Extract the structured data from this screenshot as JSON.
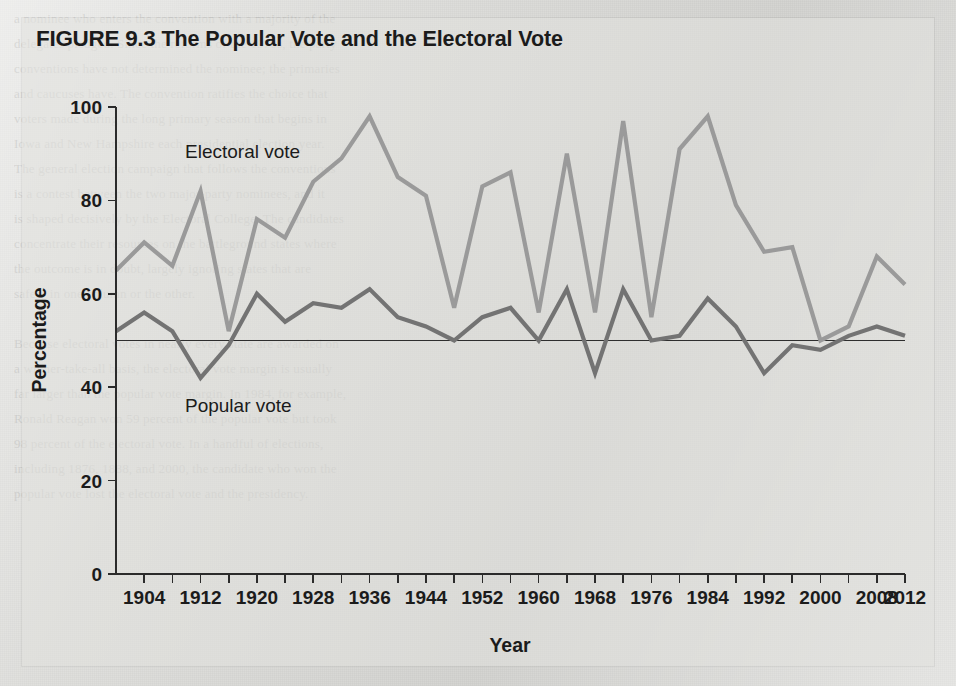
{
  "figure": {
    "number": "FIGURE 9.3",
    "title": "The Popular Vote and the Electoral Vote"
  },
  "axes": {
    "y_title": "Percentage",
    "x_title": "Year",
    "y_ticks": [
      "0",
      "20",
      "40",
      "60",
      "80",
      "100"
    ],
    "x_ticks": [
      "1904",
      "1912",
      "1920",
      "1928",
      "1936",
      "1944",
      "1952",
      "1960",
      "1968",
      "1976",
      "1984",
      "1992",
      "2000",
      "2008",
      "2012"
    ]
  },
  "annotations": {
    "electoral_label": "Electoral vote",
    "popular_label": "Popular vote"
  },
  "colors": {
    "electoral": "#9a9a9a",
    "popular": "#737373",
    "axis": "#2b2b2b",
    "background": "#dcdcd9",
    "reference_line": "#2e2e2e"
  },
  "ghost_lines": [
    "a nominee who enters the convention with a majority of the",
    "delegates pledged. Since the reforms of the 1970s, the party",
    "conventions have not determined the nominee; the primaries",
    "and caucuses have. The convention ratifies the choice that",
    "voters made during the long primary season that begins in",
    "Iowa and New Hampshire each presidential election year.",
    "The general election campaign that follows the conventions",
    "is a contest between the two major-party nominees, and it",
    "is shaped decisively by the Electoral College. The candidates",
    "concentrate their resources on the battleground states where",
    "the outcome is in doubt, largely ignoring states that are",
    "safely in one column or the other.",
    "",
    "Because electoral votes in nearly every state are awarded on",
    "a winner-take-all basis, the electoral vote margin is usually",
    "far larger than the popular vote margin. In 1984, for example,",
    "Ronald Reagan won 59 percent of the popular vote but took",
    "98 percent of the electoral vote. In a handful of elections,",
    "including 1876, 1888, and 2000, the candidate who won the",
    "popular vote lost the electoral vote and the presidency."
  ],
  "chart_data": {
    "type": "line",
    "title": "The Popular Vote and the Electoral Vote",
    "xlabel": "Year",
    "ylabel": "Percentage",
    "xlim": [
      1900,
      2012
    ],
    "ylim": [
      0,
      100
    ],
    "grid": false,
    "reference_line_y": 50,
    "legend_position": "inline-annotation",
    "x": [
      1900,
      1904,
      1908,
      1912,
      1916,
      1920,
      1924,
      1928,
      1932,
      1936,
      1940,
      1944,
      1948,
      1952,
      1956,
      1960,
      1964,
      1968,
      1972,
      1976,
      1980,
      1984,
      1988,
      1992,
      1996,
      2000,
      2004,
      2008,
      2012
    ],
    "series": [
      {
        "name": "Electoral vote",
        "color": "#9a9a9a",
        "values": [
          65,
          71,
          66,
          82,
          52,
          76,
          72,
          84,
          89,
          98,
          85,
          81,
          57,
          83,
          86,
          56,
          90,
          56,
          97,
          55,
          91,
          98,
          79,
          69,
          70,
          50,
          53,
          68,
          62
        ]
      },
      {
        "name": "Popular vote",
        "color": "#737373",
        "values": [
          52,
          56,
          52,
          42,
          49,
          60,
          54,
          58,
          57,
          61,
          55,
          53,
          50,
          55,
          57,
          50,
          61,
          43,
          61,
          50,
          51,
          59,
          53,
          43,
          49,
          48,
          51,
          53,
          51
        ]
      }
    ]
  }
}
